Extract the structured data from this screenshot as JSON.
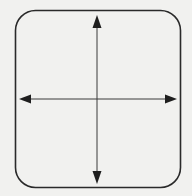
{
  "diagram": {
    "background": "#f1f1ef",
    "stroke_color": "#2a2a2a",
    "frame": {
      "x": 15,
      "y": 10,
      "width": 166,
      "height": 178,
      "radius": 20
    },
    "horizontal_arrow": {
      "y": 99,
      "x1": 19,
      "x2": 177
    },
    "vertical_arrow": {
      "x": 97,
      "y1": 15,
      "y2": 184
    }
  }
}
